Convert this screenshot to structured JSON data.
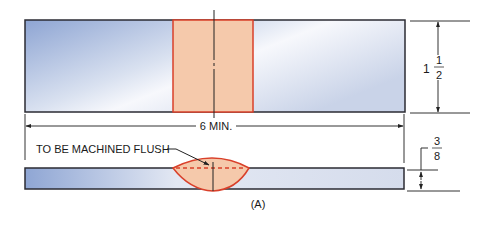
{
  "diagram": {
    "caption": "(A)",
    "dimensions": {
      "length": "6 MIN.",
      "top_height_whole": "1",
      "top_height_num": "1",
      "top_height_den": "2",
      "bottom_thickness_num": "3",
      "bottom_thickness_den": "8"
    },
    "callouts": {
      "machined_flush": "TO BE MACHINED FLUSH"
    },
    "colors": {
      "plate_dark": "#8fa6d4",
      "plate_light": "#f2f4fa",
      "weld_fill": "#f5c9ab",
      "weld_stroke": "#d9402a",
      "outline": "#2b2b33",
      "dim_line": "#333333"
    }
  }
}
